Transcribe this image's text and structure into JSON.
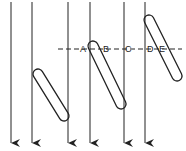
{
  "diagram": {
    "type": "line-diagram",
    "vertical_lines": [
      {
        "x": 11,
        "y1": 2,
        "y2": 143
      },
      {
        "x": 32,
        "y1": 2,
        "y2": 143
      },
      {
        "x": 68,
        "y1": 2,
        "y2": 143
      },
      {
        "x": 90,
        "y1": 2,
        "y2": 143
      },
      {
        "x": 124,
        "y1": 2,
        "y2": 143
      },
      {
        "x": 145,
        "y1": 2,
        "y2": 143
      }
    ],
    "capsules": [
      {
        "x1": 38,
        "y1": 74,
        "x2": 64,
        "y2": 116
      },
      {
        "x1": 93,
        "y1": 46,
        "x2": 121,
        "y2": 104
      },
      {
        "x1": 149,
        "y1": 20,
        "x2": 177,
        "y2": 76
      }
    ],
    "dashed_line": {
      "x1": 58,
      "x2": 182,
      "y": 49
    },
    "labels": [
      {
        "text": "A",
        "x": 80,
        "y": 52
      },
      {
        "text": "B",
        "x": 103,
        "y": 52
      },
      {
        "text": "C",
        "x": 125,
        "y": 52
      },
      {
        "text": "D",
        "x": 147,
        "y": 52
      },
      {
        "text": "E",
        "x": 159,
        "y": 52
      }
    ],
    "stroke_color": "#222222"
  }
}
